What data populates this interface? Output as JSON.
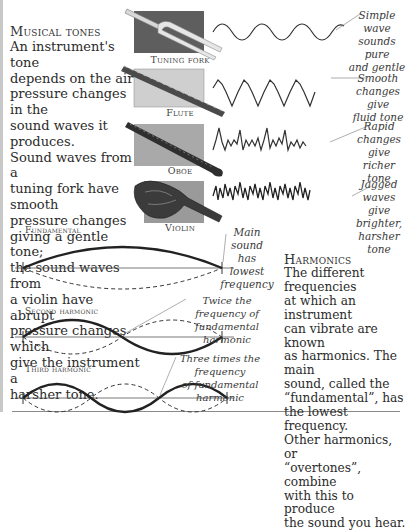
{
  "musical_tones": {
    "heading": "Musical tones",
    "lines": [
      "An instrument's tone",
      "depends on the air",
      "pressure changes in the",
      "sound waves it produces.",
      "Sound waves from a",
      "tuning fork have smooth",
      "pressure changes",
      "giving a gentle tone;",
      "the sound waves from",
      "a violin have abrupt",
      "pressure changes which",
      "give the instrument a",
      "harsher tone."
    ]
  },
  "instruments": [
    {
      "name": "Tuning fork",
      "note": [
        "Simple wave",
        "sounds pure",
        "and gentle"
      ],
      "panel_color": "#5e5e5e"
    },
    {
      "name": "Flute",
      "note": [
        "Smooth",
        "changes give",
        "fluid tone"
      ],
      "panel_color": "#cfcfcf"
    },
    {
      "name": "Oboe",
      "note": [
        "Rapid",
        "changes give",
        "richer tone"
      ],
      "panel_color": "#a9a9a9"
    },
    {
      "name": "Violin",
      "note": [
        "Jagged",
        "waves give",
        "brighter,",
        "harsher tone"
      ],
      "panel_color": "#9a9a9a"
    }
  ],
  "harmonics_diagram": {
    "fundamental": {
      "label": "Fundamental",
      "note": [
        "Main sound",
        "has lowest",
        "frequency"
      ]
    },
    "second": {
      "label": "Second harmonic",
      "note": [
        "Twice the frequency of",
        "fundamental harmonic"
      ]
    },
    "third": {
      "label": "Third harmonic",
      "note": [
        "Three times the frequency",
        "of fundamental harmonic"
      ]
    }
  },
  "harmonics_text": {
    "heading": "Harmonics",
    "lines": [
      "The different frequencies",
      "at which an instrument",
      "can vibrate are known",
      "as harmonics. The main",
      "sound, called the",
      "“fundamental”, has",
      "the lowest frequency.",
      "Other harmonics, or",
      "“overtones”, combine",
      "with this to produce",
      "the sound you hear."
    ]
  }
}
